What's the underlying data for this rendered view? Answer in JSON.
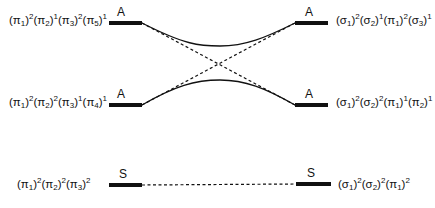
{
  "diagram": {
    "type": "orbital-correlation-diagram",
    "left_configs": [
      {
        "terms": [
          {
            "o": "π",
            "s": "1",
            "e": "2"
          },
          {
            "o": "π",
            "s": "2",
            "e": "1"
          },
          {
            "o": "π",
            "s": "3",
            "e": "2"
          },
          {
            "o": "π",
            "s": "5",
            "e": "1"
          }
        ],
        "symmetry": "A"
      },
      {
        "terms": [
          {
            "o": "π",
            "s": "1",
            "e": "2"
          },
          {
            "o": "π",
            "s": "2",
            "e": "2"
          },
          {
            "o": "π",
            "s": "3",
            "e": "1"
          },
          {
            "o": "π",
            "s": "4",
            "e": "1"
          }
        ],
        "symmetry": "A"
      },
      {
        "terms": [
          {
            "o": "π",
            "s": "1",
            "e": "2"
          },
          {
            "o": "π",
            "s": "2",
            "e": "2"
          },
          {
            "o": "π",
            "s": "3",
            "e": "2"
          }
        ],
        "symmetry": "S"
      }
    ],
    "right_configs": [
      {
        "terms": [
          {
            "o": "σ",
            "s": "1",
            "e": "2"
          },
          {
            "o": "σ",
            "s": "2",
            "e": "1"
          },
          {
            "o": "π",
            "s": "1",
            "e": "2"
          },
          {
            "o": "σ",
            "s": "3",
            "e": "1"
          }
        ],
        "symmetry": "A"
      },
      {
        "terms": [
          {
            "o": "σ",
            "s": "1",
            "e": "2"
          },
          {
            "o": "σ",
            "s": "2",
            "e": "2"
          },
          {
            "o": "π",
            "s": "1",
            "e": "1"
          },
          {
            "o": "π",
            "s": "2",
            "e": "1"
          }
        ],
        "symmetry": "A"
      },
      {
        "terms": [
          {
            "o": "σ",
            "s": "1",
            "e": "2"
          },
          {
            "o": "σ",
            "s": "2",
            "e": "2"
          },
          {
            "o": "π",
            "s": "1",
            "e": "2"
          }
        ],
        "symmetry": "S"
      }
    ],
    "labels": {
      "left_top_sym": "A",
      "left_mid_sym": "A",
      "left_bot_sym": "S",
      "right_top_sym": "A",
      "right_mid_sym": "A",
      "right_bot_sym": "S"
    },
    "correlations": [
      {
        "from": "left_top",
        "to": "right_top",
        "style": "solid",
        "kind": "avoided-crossing"
      },
      {
        "from": "left_mid",
        "to": "right_mid",
        "style": "solid",
        "kind": "avoided-crossing"
      },
      {
        "from": "left_top",
        "to": "right_mid",
        "style": "dashed",
        "kind": "diabatic"
      },
      {
        "from": "left_mid",
        "to": "right_top",
        "style": "dashed",
        "kind": "diabatic"
      },
      {
        "from": "left_bot",
        "to": "right_bot",
        "style": "dashed",
        "kind": "direct"
      }
    ]
  }
}
